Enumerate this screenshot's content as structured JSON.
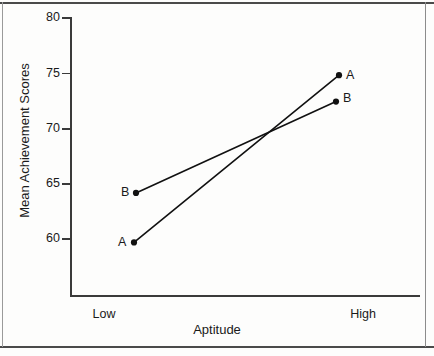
{
  "chart_data": {
    "type": "line",
    "title": "",
    "subtitle": "",
    "xlabel": "Aptitude",
    "ylabel": "Mean Achievement Scores",
    "categories": [
      "Low",
      "High"
    ],
    "series": [
      {
        "name": "A",
        "values": [
          59.6,
          74.8
        ]
      },
      {
        "name": "B",
        "values": [
          64.1,
          72.4
        ]
      }
    ],
    "ylim": [
      57,
      80
    ],
    "yticks": [
      80,
      75,
      70,
      65,
      60
    ],
    "ytick_labels": [
      "80",
      "75",
      "70",
      "65",
      "60"
    ],
    "grid": false,
    "legend": "none",
    "annotations": [
      {
        "text": "A",
        "series": "A",
        "category": "Low",
        "position": "left"
      },
      {
        "text": "A",
        "series": "A",
        "category": "High",
        "position": "right"
      },
      {
        "text": "B",
        "series": "B",
        "category": "Low",
        "position": "left"
      },
      {
        "text": "B",
        "series": "B",
        "category": "High",
        "position": "right"
      }
    ],
    "marker": "filled-circle",
    "line_color": "#111111",
    "marker_color": "#111111",
    "background_color": "#fdfdfc",
    "crossing_point_note": "lines cross near y = 70"
  },
  "axis": {
    "y_ticks": [
      {
        "label": "80",
        "top": 17
      },
      {
        "label": "75",
        "top": 72.5
      },
      {
        "label": "70",
        "top": 128
      },
      {
        "label": "65",
        "top": 183
      },
      {
        "label": "60",
        "top": 238
      }
    ],
    "x_categories": [
      {
        "label": "Low",
        "center": 104
      },
      {
        "label": "High",
        "center": 363
      }
    ]
  },
  "labels": {
    "a_low": "A",
    "a_high": "A",
    "b_low": "B",
    "b_high": "B"
  }
}
